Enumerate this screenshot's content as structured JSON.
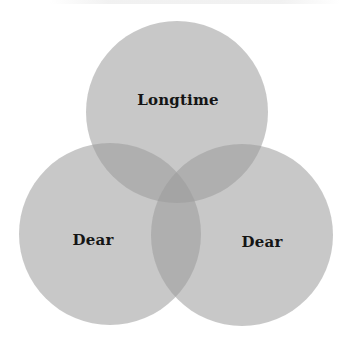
{
  "diagram": {
    "type": "venn",
    "circles": [
      {
        "label": "Longtime",
        "cx": 177,
        "cy": 112,
        "r": 91
      },
      {
        "label": "Dear",
        "cx": 110,
        "cy": 234,
        "r": 91
      },
      {
        "label": "Dear",
        "cx": 242,
        "cy": 235,
        "r": 91
      }
    ],
    "colors": {
      "circle_fill": "#c6c6c6",
      "overlap_fill": "#b4b4b4",
      "label_text": "#151515",
      "background": "#ffffff"
    }
  }
}
